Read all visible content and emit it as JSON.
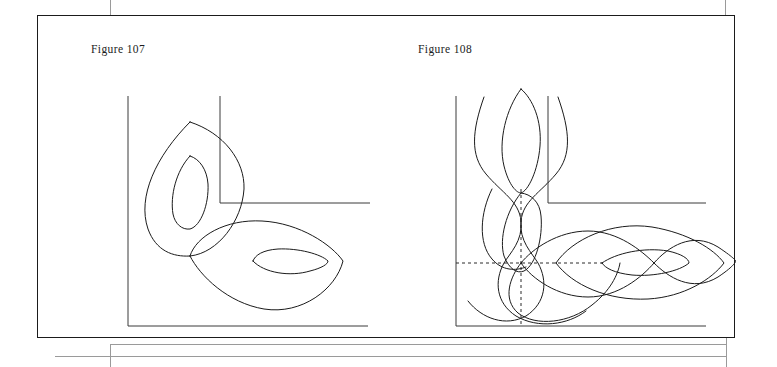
{
  "page": {
    "background_color": "#ffffff",
    "ink_color": "#1b1b1b",
    "plate_border_color": "#1b1b1b",
    "width": 777,
    "height": 367
  },
  "figures": [
    {
      "id": "figure-107",
      "caption": "Figure 107",
      "description": "Two interlocked lens (vesica) loops, each with a concentric inner lens, drawn inside an L-shaped corner frame",
      "frame": {
        "outer_corner": {
          "vertical_x": 50,
          "top_y": 25,
          "bottom_y": 255,
          "horizontal_x_end": 290
        },
        "inner_corner": {
          "vertical_x": 142,
          "top_y": 25,
          "bottom_y": 132,
          "horizontal_x_end": 292
        }
      },
      "curves": [
        {
          "name": "outer-vertical-lens",
          "orientation": "vertical",
          "top": [
            112,
            51
          ],
          "bottom": [
            112,
            185
          ],
          "half_width": 53
        },
        {
          "name": "inner-vertical-lens",
          "orientation": "vertical",
          "top": [
            112,
            85
          ],
          "bottom": [
            112,
            158
          ],
          "half_width": 17
        },
        {
          "name": "outer-horizontal-lens",
          "orientation": "horizontal",
          "left": [
            130,
            190
          ],
          "right": [
            265,
            190
          ],
          "half_height": 47
        },
        {
          "name": "inner-horizontal-lens",
          "orientation": "horizontal",
          "left": [
            175,
            190
          ],
          "right": [
            250,
            190
          ],
          "half_height": 14
        }
      ]
    },
    {
      "id": "figure-108",
      "caption": "Figure 108",
      "description": "Lissajous-style interlaced braid: two vertical sinusoid strands crossing above, two horizontal strands weaving to the right, with dashed crosshair guide lines through the central node",
      "frame": {
        "outer_corner": {
          "vertical_x": 50,
          "top_y": 25,
          "bottom_y": 255,
          "horizontal_x_end": 300
        },
        "inner_corner": {
          "vertical_x": 142,
          "top_y": 25,
          "bottom_y": 132,
          "horizontal_x_end": 300
        }
      },
      "guides": {
        "horizontal_dashed_y": 192,
        "vertical_dashed_x": 115,
        "node": [
          115,
          192
        ]
      },
      "curves": [
        {
          "name": "vertical-strand-left",
          "orientation": "vertical"
        },
        {
          "name": "vertical-strand-right",
          "orientation": "vertical"
        },
        {
          "name": "upper-vertical-lens",
          "orientation": "vertical"
        },
        {
          "name": "horizontal-strand-upper",
          "orientation": "horizontal"
        },
        {
          "name": "horizontal-strand-lower",
          "orientation": "horizontal"
        },
        {
          "name": "right-inner-lens",
          "orientation": "horizontal"
        }
      ]
    }
  ]
}
